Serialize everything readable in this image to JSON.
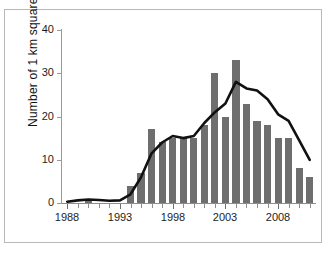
{
  "figure": {
    "y_axis_title": "Number of 1 km squares",
    "y_ticks": [
      "0",
      "10",
      "20",
      "30",
      "40"
    ],
    "x_ticks": [
      "1988",
      "1993",
      "1998",
      "2003",
      "2008"
    ],
    "bar_color": "#6e6e6e",
    "line_color": "#111111",
    "axis_color": "#8e8e8e",
    "background": "#ffffff"
  },
  "chart_data": {
    "type": "bar",
    "title": "",
    "xlabel": "",
    "ylabel": "Number of 1 km squares",
    "ylim": [
      0,
      40
    ],
    "xlim": [
      1987.5,
      2011.5
    ],
    "grid": false,
    "legend": "none",
    "categories": [
      "1988",
      "1989",
      "1990",
      "1991",
      "1992",
      "1993",
      "1994",
      "1995",
      "1996",
      "1997",
      "1998",
      "1999",
      "2000",
      "2001",
      "2002",
      "2003",
      "2004",
      "2005",
      "2006",
      "2007",
      "2008",
      "2009",
      "2010",
      "2011"
    ],
    "series": [
      {
        "name": "Number of 1 km squares",
        "type": "bar",
        "values": [
          0,
          0,
          1,
          0,
          0,
          0,
          4,
          7,
          17,
          14,
          15,
          15,
          15,
          18,
          30,
          20,
          33,
          23,
          19,
          18,
          15,
          15,
          8,
          6
        ]
      },
      {
        "name": "Trend (smoothed)",
        "type": "line",
        "values": [
          0.3,
          0.6,
          0.8,
          0.7,
          0.5,
          0.6,
          2.0,
          6.0,
          11.5,
          14.0,
          15.5,
          15.0,
          15.5,
          18.5,
          21.0,
          23.0,
          28.0,
          26.5,
          26.0,
          24.0,
          20.5,
          19.0,
          14.5,
          10.0
        ]
      }
    ]
  }
}
